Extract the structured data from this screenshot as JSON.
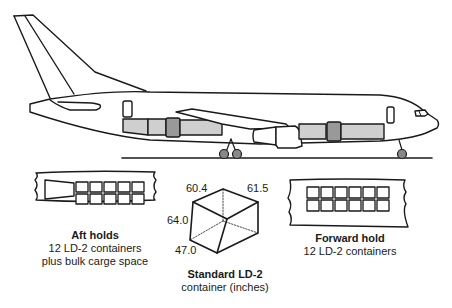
{
  "aircraft": {
    "colors": {
      "outline": "#1a1a1a",
      "container_light": "#cfcfcf",
      "container_dark": "#999999",
      "background": "#ffffff"
    }
  },
  "aft_hold": {
    "title": "Aft holds",
    "line1": "12 LD-2 containers",
    "line2": "plus bulk carge space",
    "grid_rows": 2,
    "grid_cols": 5
  },
  "forward_hold": {
    "title": "Forward hold",
    "line1": "12 LD-2 containers",
    "grid_rows": 2,
    "grid_cols": 6
  },
  "ld2_container": {
    "title": "Standard LD-2",
    "subtitle": "container (inches)",
    "dimensions": {
      "top_left": "60.4",
      "top_right": "61.5",
      "left": "64.0",
      "bottom": "47.0"
    }
  }
}
